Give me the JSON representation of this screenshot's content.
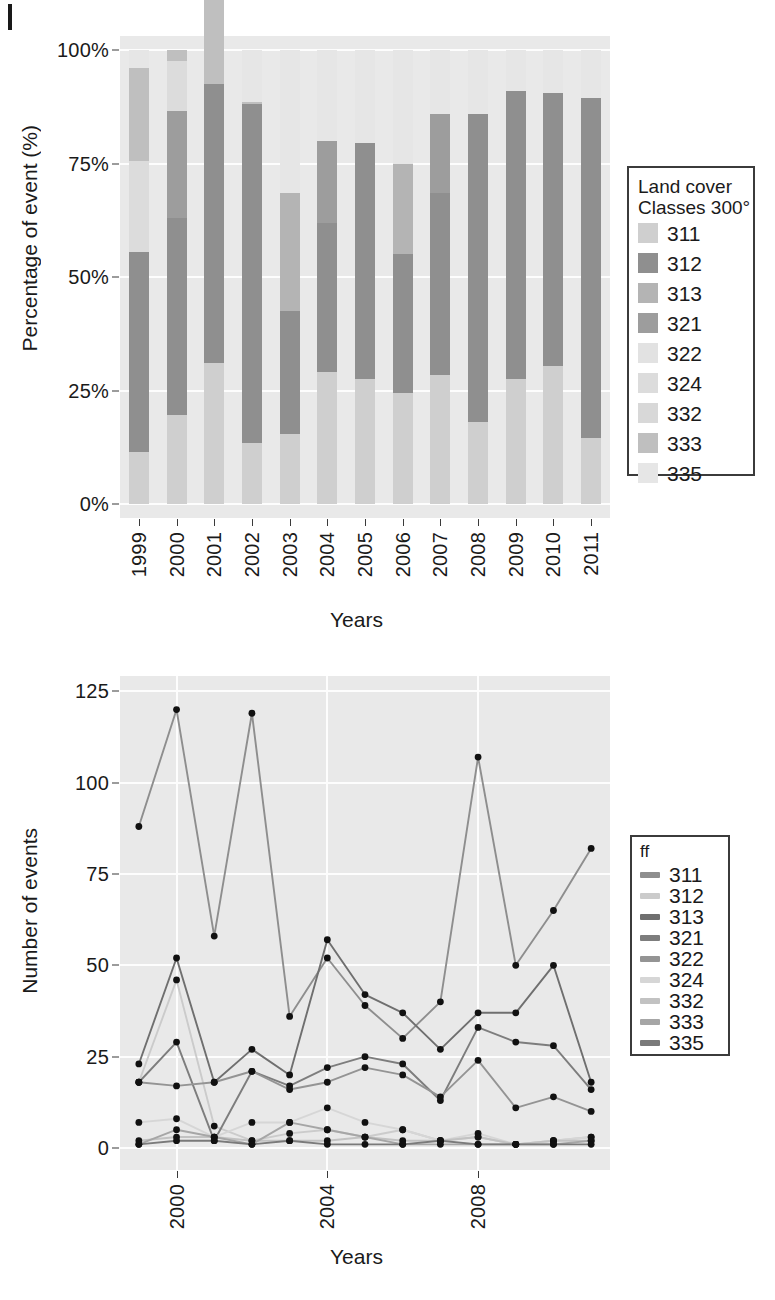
{
  "classes": [
    "311",
    "312",
    "313",
    "321",
    "322",
    "324",
    "332",
    "333",
    "335"
  ],
  "class_colors": {
    "311": "#cfcfcf",
    "312": "#8f8f8f",
    "313": "#b4b4b4",
    "321": "#9d9d9d",
    "322": "#e2e2e2",
    "324": "#dcdcdc",
    "332": "#d8d8d8",
    "333": "#bfbfbf",
    "335": "#e6e6e6"
  },
  "line_colors": {
    "311": "#8e8e8e",
    "312": "#cbcbcb",
    "313": "#6f6f6f",
    "321": "#7d7d7d",
    "322": "#949494",
    "324": "#d6d6d6",
    "332": "#c2c2c2",
    "333": "#a6a6a6",
    "335": "#7a7a7a"
  },
  "panel_bg": "#e9e9e9",
  "grid_color": "#fdfdfd",
  "top": {
    "legend": {
      "title_line1": "Land cover",
      "title_line2": "Classes 300°",
      "items": [
        "311",
        "312",
        "313",
        "321",
        "322",
        "324",
        "332",
        "333",
        "335"
      ]
    },
    "chart_data": {
      "type": "bar",
      "subtype": "stacked-percent",
      "title": "",
      "xlabel": "Years",
      "ylabel": "Percentage of event (%)",
      "ylim": [
        0,
        100
      ],
      "ytick_labels": [
        "0%",
        "25%",
        "50%",
        "75%",
        "100%"
      ],
      "ytick_values": [
        0,
        25,
        50,
        75,
        100
      ],
      "grid": "horizontal-major",
      "legend_position": "right",
      "categories": [
        "1999",
        "2000",
        "2001",
        "2002",
        "2003",
        "2004",
        "2005",
        "2006",
        "2007",
        "2008",
        "2009",
        "2010",
        "2011"
      ],
      "series": [
        {
          "name": "311",
          "values": [
            11.5,
            19.5,
            31.0,
            13.5,
            15.5,
            29.0,
            27.5,
            24.5,
            28.5,
            18.0,
            27.5,
            30.5,
            14.5
          ]
        },
        {
          "name": "312",
          "values": [
            44.0,
            43.5,
            61.5,
            74.5,
            27.0,
            33.0,
            52.0,
            30.5,
            40.0,
            68.0,
            63.5,
            60.0,
            75.0
          ]
        },
        {
          "name": "313",
          "values": [
            0.0,
            0.0,
            0.0,
            0.0,
            26.0,
            0.0,
            0.0,
            20.0,
            0.0,
            0.0,
            0.0,
            0.0,
            0.0
          ]
        },
        {
          "name": "321",
          "values": [
            0.0,
            23.5,
            0.0,
            0.0,
            0.0,
            18.0,
            0.0,
            0.0,
            17.5,
            0.0,
            0.0,
            0.0,
            0.0
          ]
        },
        {
          "name": "322",
          "values": [
            0.0,
            0.0,
            0.0,
            0.0,
            0.0,
            0.0,
            0.0,
            0.0,
            0.0,
            0.0,
            0.0,
            0.0,
            0.0
          ]
        },
        {
          "name": "324",
          "values": [
            20.0,
            11.0,
            0.0,
            0.0,
            0.0,
            0.0,
            0.0,
            0.0,
            0.0,
            0.0,
            0.0,
            0.0,
            0.0
          ]
        },
        {
          "name": "332",
          "values": [
            0.0,
            0.0,
            0.0,
            0.0,
            0.0,
            0.0,
            0.0,
            0.0,
            0.0,
            0.0,
            0.0,
            0.0,
            0.0
          ]
        },
        {
          "name": "333",
          "values": [
            20.5,
            2.5,
            30.5,
            0.5,
            0.0,
            0.0,
            0.0,
            0.0,
            0.0,
            0.0,
            0.0,
            0.0,
            0.0
          ]
        },
        {
          "name": "335",
          "values": [
            4.0,
            0.0,
            7.0,
            11.5,
            31.5,
            20.0,
            20.5,
            25.0,
            14.0,
            14.0,
            9.0,
            9.5,
            10.5
          ]
        }
      ],
      "bar_tops_pct": [
        100,
        100,
        93,
        88,
        68,
        80,
        80,
        75,
        86,
        86,
        91,
        91,
        89
      ]
    }
  },
  "bottom": {
    "legend": {
      "title": "ff",
      "items": [
        "311",
        "312",
        "313",
        "321",
        "322",
        "324",
        "332",
        "333",
        "335"
      ]
    },
    "chart_data": {
      "type": "line",
      "title": "",
      "xlabel": "Years",
      "ylabel": "Number of events",
      "ylim": [
        0,
        127
      ],
      "ytick_labels": [
        "0",
        "25",
        "50",
        "75",
        "100",
        "125"
      ],
      "ytick_values": [
        0,
        25,
        50,
        75,
        100,
        125
      ],
      "xtick_labels": [
        "2000",
        "2004",
        "2008"
      ],
      "xtick_values": [
        2000,
        2004,
        2008
      ],
      "x": [
        1999,
        2000,
        2001,
        2002,
        2003,
        2004,
        2005,
        2006,
        2007,
        2008,
        2009,
        2010,
        2011
      ],
      "grid": "both-major",
      "legend_position": "right",
      "series": [
        {
          "name": "311",
          "values": [
            88,
            120,
            58,
            119,
            36,
            52,
            39,
            30,
            40,
            107,
            50,
            65,
            82
          ]
        },
        {
          "name": "312",
          "values": [
            18,
            46,
            6,
            2,
            4,
            5,
            3,
            5,
            2,
            3,
            1,
            2,
            3
          ]
        },
        {
          "name": "313",
          "values": [
            23,
            52,
            18,
            27,
            20,
            57,
            42,
            37,
            27,
            37,
            37,
            50,
            18
          ]
        },
        {
          "name": "321",
          "values": [
            18,
            29,
            2,
            21,
            17,
            22,
            25,
            23,
            13,
            33,
            29,
            28,
            16
          ]
        },
        {
          "name": "322",
          "values": [
            18,
            17,
            18,
            21,
            16,
            18,
            22,
            20,
            14,
            24,
            11,
            14,
            10
          ]
        },
        {
          "name": "324",
          "values": [
            7,
            8,
            3,
            7,
            7,
            11,
            7,
            5,
            2,
            4,
            1,
            2,
            3
          ]
        },
        {
          "name": "332",
          "values": [
            2,
            3,
            3,
            2,
            2,
            2,
            3,
            2,
            2,
            3,
            1,
            2,
            2
          ]
        },
        {
          "name": "333",
          "values": [
            1,
            5,
            3,
            1,
            7,
            5,
            3,
            1,
            1,
            1,
            1,
            1,
            2
          ]
        },
        {
          "name": "335",
          "values": [
            1,
            2,
            2,
            1,
            2,
            1,
            1,
            1,
            2,
            1,
            1,
            1,
            1
          ]
        }
      ]
    }
  }
}
